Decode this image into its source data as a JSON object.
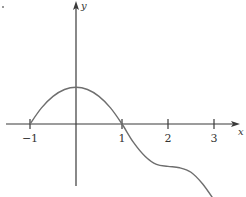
{
  "chart_data": {
    "type": "line",
    "title": "",
    "xlabel": "x",
    "ylabel": "y",
    "xlim": [
      -1.5,
      3.5
    ],
    "ylim": [
      -1.6,
      2.6
    ],
    "x_ticks": [
      -1,
      1,
      2,
      3
    ],
    "x_tick_labels": [
      "−1",
      "1",
      "2",
      "3"
    ],
    "grid": false,
    "legend": "none",
    "series": [
      {
        "name": "f(x)",
        "x": [
          -1.0,
          -0.75,
          -0.5,
          -0.25,
          0.0,
          0.25,
          0.5,
          0.75,
          1.0,
          1.25,
          1.5,
          1.75,
          2.0,
          2.25,
          2.5,
          2.75,
          3.0
        ],
        "y": [
          0.0,
          0.35,
          0.6,
          0.75,
          0.8,
          0.75,
          0.6,
          0.35,
          0.0,
          -0.4,
          -0.7,
          -0.88,
          -0.92,
          -0.95,
          -1.05,
          -1.3,
          -1.65
        ]
      }
    ],
    "annotations": []
  }
}
